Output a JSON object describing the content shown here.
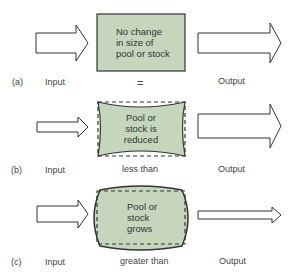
{
  "colors": {
    "fill": "#c5d6bc",
    "stroke": "#333333",
    "arrow_fill": "#ffffff"
  },
  "panels": [
    {
      "id": "a",
      "tag": "(a)",
      "input_label": "Input",
      "output_label": "Output",
      "relation": "=",
      "box_text": [
        "No change",
        "in size of",
        "pool or stock"
      ]
    },
    {
      "id": "b",
      "tag": "(b)",
      "input_label": "Input",
      "output_label": "Output",
      "relation": "less than",
      "box_text": [
        "Pool or",
        "stock is",
        "reduced"
      ]
    },
    {
      "id": "c",
      "tag": "(c)",
      "input_label": "Input",
      "output_label": "Output",
      "relation": "greater than",
      "box_text": [
        "Pool or",
        "stock",
        "grows"
      ]
    }
  ]
}
